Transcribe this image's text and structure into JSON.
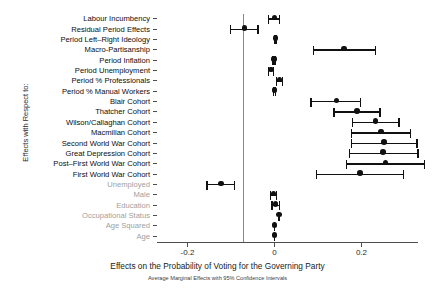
{
  "chart_data": {
    "type": "scatter",
    "title": "",
    "xlabel": "Effects on the Probability of Voting for the Governing Party",
    "subtitle": "Average Marginal Effects with 95% Confidence Intervals",
    "ylabel": "Effects with Respect to:",
    "xlim": [
      -0.27,
      0.33
    ],
    "xticks": [
      -0.2,
      0,
      0.2,
      0.4
    ],
    "xticklabels": [
      "-0.2",
      "0",
      "0.2",
      "0.4"
    ],
    "grid": false,
    "legend": null,
    "zero_reference_line": 0,
    "orientation": "horizontal",
    "categories": [
      "Labour Incumbency",
      "Residual Period Effects",
      "Period Left–Right Ideology",
      "Macro-Partisanship",
      "Period Inflation",
      "Period Unemployment",
      "Period % Professionals",
      "Period % Manual Workers",
      "Blair Cohort",
      "Thatcher Cohort",
      "Wilson/Callaghan Cohort",
      "Macmillan Cohort",
      "Second World War Cohort",
      "Great Depression Cohort",
      "Post–First World War Cohort",
      "First World War Cohort",
      "Unemployed",
      "Male",
      "Education",
      "Occupational Status",
      "Age Squared",
      "Age"
    ],
    "label_styles": [
      "dark",
      "dark",
      "dark",
      "dark",
      "dark",
      "dark",
      "dark",
      "dark",
      "dark",
      "dark",
      "dark",
      "dark",
      "dark",
      "dark",
      "dark",
      "dark",
      "dim",
      "dim",
      "dim",
      "dim",
      "dim",
      "dim"
    ],
    "points": [
      {
        "category": "Labour Incumbency",
        "estimate": 0.0,
        "ci_low": -0.013,
        "ci_high": 0.012
      },
      {
        "category": "Residual Period Effects",
        "estimate": -0.069,
        "ci_low": -0.101,
        "ci_high": -0.038
      },
      {
        "category": "Period Left–Right Ideology",
        "estimate": 0.002,
        "ci_low": 0.0,
        "ci_high": 0.004
      },
      {
        "category": "Macro-Partisanship",
        "estimate": 0.16,
        "ci_low": 0.09,
        "ci_high": 0.232
      },
      {
        "category": "Period Inflation",
        "estimate": -0.001,
        "ci_low": -0.003,
        "ci_high": 0.001
      },
      {
        "category": "Period Unemployment",
        "estimate": -0.008,
        "ci_low": -0.014,
        "ci_high": -0.002
      },
      {
        "category": "Period % Professionals",
        "estimate": 0.012,
        "ci_low": 0.005,
        "ci_high": 0.019
      },
      {
        "category": "Period % Manual Workers",
        "estimate": 0.0,
        "ci_low": -0.002,
        "ci_high": 0.002
      },
      {
        "category": "Blair Cohort",
        "estimate": 0.143,
        "ci_low": 0.084,
        "ci_high": 0.198
      },
      {
        "category": "Thatcher Cohort",
        "estimate": 0.19,
        "ci_low": 0.137,
        "ci_high": 0.243
      },
      {
        "category": "Wilson/Callaghan Cohort",
        "estimate": 0.232,
        "ci_low": 0.18,
        "ci_high": 0.286
      },
      {
        "category": "Macmillan Cohort",
        "estimate": 0.245,
        "ci_low": 0.177,
        "ci_high": 0.313
      },
      {
        "category": "Second World War Cohort",
        "estimate": 0.252,
        "ci_low": 0.177,
        "ci_high": 0.328
      },
      {
        "category": "Great Depression Cohort",
        "estimate": 0.25,
        "ci_low": 0.172,
        "ci_high": 0.33
      },
      {
        "category": "Post–First World War Cohort",
        "estimate": 0.255,
        "ci_low": 0.166,
        "ci_high": 0.345
      },
      {
        "category": "First World War Cohort",
        "estimate": 0.196,
        "ci_low": 0.097,
        "ci_high": 0.296
      },
      {
        "category": "Unemployed",
        "estimate": -0.123,
        "ci_low": -0.155,
        "ci_high": -0.092
      },
      {
        "category": "Male",
        "estimate": -0.002,
        "ci_low": -0.009,
        "ci_high": 0.005
      },
      {
        "category": "Education",
        "estimate": 0.002,
        "ci_low": -0.006,
        "ci_high": 0.011
      },
      {
        "category": "Occupational Status",
        "estimate": 0.01,
        "ci_low": 0.009,
        "ci_high": 0.012
      },
      {
        "category": "Age Squared",
        "estimate": 0.0,
        "ci_low": 0.0,
        "ci_high": 0.0
      },
      {
        "category": "Age",
        "estimate": 0.0,
        "ci_low": 0.0,
        "ci_high": 0.0
      }
    ],
    "colors": {
      "marker": "#111111",
      "axis": "#4d4d4d",
      "zero_line": "#8a8a8a",
      "label_dark": "#0d0d0d",
      "label_dim": "#a0a0a0"
    }
  }
}
